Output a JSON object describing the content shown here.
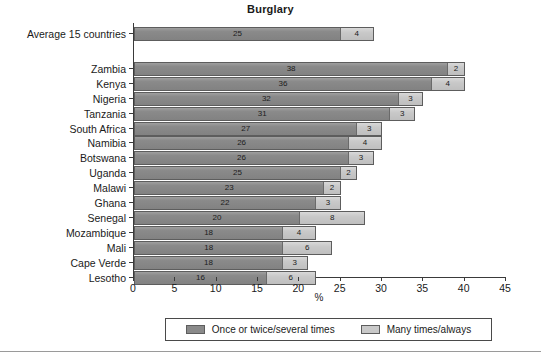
{
  "chart_data": {
    "type": "bar",
    "orientation": "horizontal",
    "stacked": true,
    "title": "Burglary",
    "xlabel": "%",
    "ylabel": "",
    "xlim": [
      0,
      45
    ],
    "xticks": [
      0,
      5,
      10,
      15,
      20,
      25,
      30,
      35,
      40,
      45
    ],
    "grid": false,
    "legend_position": "bottom",
    "categories": [
      "Average 15 countries",
      "Zambia",
      "Kenya",
      "Nigeria",
      "Tanzania",
      "South Africa",
      "Namibia",
      "Botswana",
      "Uganda",
      "Malawi",
      "Ghana",
      "Senegal",
      "Mozambique",
      "Mali",
      "Cape Verde",
      "Lesotho"
    ],
    "series": [
      {
        "name": "Once or twice/several times",
        "color": "#8a8a8a",
        "values": [
          25,
          38,
          36,
          32,
          31,
          27,
          26,
          26,
          25,
          23,
          22,
          20,
          18,
          18,
          18,
          16
        ]
      },
      {
        "name": "Many times/always",
        "color": "#c9c9c9",
        "values": [
          4,
          2,
          4,
          3,
          3,
          3,
          4,
          3,
          2,
          2,
          3,
          8,
          4,
          6,
          3,
          6
        ]
      }
    ],
    "totals": [
      29,
      40,
      40,
      35,
      34,
      30,
      30,
      29,
      27,
      25,
      25,
      28,
      22,
      24,
      21,
      22
    ],
    "gap_after_first_category": true
  },
  "legend": {
    "entries": [
      {
        "label": "Once or twice/several times",
        "swatch": "dark-gray-swatch"
      },
      {
        "label": "Many times/always",
        "swatch": "light-gray-swatch"
      }
    ]
  }
}
